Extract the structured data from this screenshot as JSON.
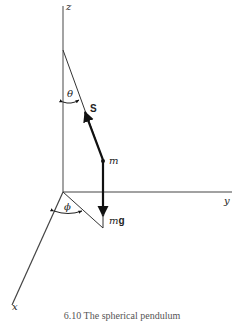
{
  "figure": {
    "axes": {
      "z_label": "z",
      "y_label": "y",
      "x_label": "x"
    },
    "angles": {
      "theta": "θ",
      "phi": "ϕ"
    },
    "vectors": {
      "tension_label": "S",
      "weight_label_italic": "m",
      "weight_label_bold": "g"
    },
    "mass_label": "m",
    "caption": "6.10  The spherical pendulum"
  },
  "colors": {
    "line": "#222222",
    "axis": "#666666",
    "background": "#ffffff"
  }
}
